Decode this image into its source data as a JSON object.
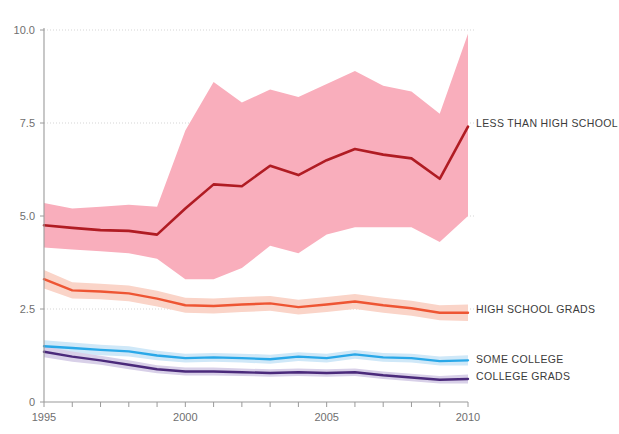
{
  "chart_data": {
    "type": "line",
    "title": "",
    "subtitle": "",
    "xlabel": "",
    "ylabel": "",
    "xlim": [
      1995,
      2010
    ],
    "ylim": [
      0,
      10
    ],
    "grid": true,
    "legend_position": "right-inline",
    "x": [
      1995,
      1996,
      1997,
      1998,
      1999,
      2000,
      2001,
      2002,
      2003,
      2004,
      2005,
      2006,
      2007,
      2008,
      2009,
      2010
    ],
    "x_ticks": [
      1995,
      1996,
      1997,
      1998,
      1999,
      2000,
      2001,
      2002,
      2003,
      2004,
      2005,
      2006,
      2007,
      2008,
      2009,
      2010
    ],
    "x_tick_labels": [
      "1995",
      "",
      "",
      "",
      "",
      "2000",
      "",
      "",
      "",
      "",
      "2005",
      "",
      "",
      "",
      "",
      "2010"
    ],
    "y_ticks": [
      0,
      2.5,
      5.0,
      7.5,
      10.0
    ],
    "y_tick_labels": [
      "0",
      "2.5",
      "5.0",
      "7.5",
      "10.0"
    ],
    "series": [
      {
        "name": "LESS THAN HIGH SCHOOL",
        "color": "#b01c23",
        "band_color": "#f9aebc",
        "label_y": 7.48,
        "values": [
          4.75,
          4.68,
          4.62,
          4.6,
          4.5,
          5.2,
          5.85,
          5.8,
          6.35,
          6.1,
          6.5,
          6.8,
          6.65,
          6.55,
          6.0,
          7.4
        ],
        "band_upper": [
          5.35,
          5.2,
          5.25,
          5.3,
          5.25,
          7.3,
          8.6,
          8.05,
          8.4,
          8.2,
          8.55,
          8.9,
          8.5,
          8.35,
          7.75,
          9.9
        ],
        "band_lower": [
          4.15,
          4.1,
          4.05,
          4.0,
          3.85,
          3.3,
          3.3,
          3.6,
          4.2,
          4.0,
          4.5,
          4.7,
          4.7,
          4.7,
          4.3,
          5.0
        ]
      },
      {
        "name": "HIGH SCHOOL GRADS",
        "color": "#ee5533",
        "band_color": "#fad4c8",
        "label_y": 2.48,
        "values": [
          3.3,
          3.0,
          2.97,
          2.92,
          2.78,
          2.6,
          2.58,
          2.62,
          2.65,
          2.55,
          2.62,
          2.7,
          2.6,
          2.52,
          2.4,
          2.4
        ],
        "band_upper": [
          3.55,
          3.22,
          3.18,
          3.13,
          2.99,
          2.8,
          2.78,
          2.82,
          2.85,
          2.75,
          2.82,
          2.9,
          2.8,
          2.72,
          2.6,
          2.62
        ],
        "band_lower": [
          3.05,
          2.78,
          2.76,
          2.71,
          2.57,
          2.4,
          2.38,
          2.42,
          2.45,
          2.35,
          2.42,
          2.5,
          2.4,
          2.32,
          2.2,
          2.18
        ]
      },
      {
        "name": "SOME COLLEGE",
        "color": "#29a8e8",
        "band_color": "#cfe8f8",
        "label_y": 1.12,
        "values": [
          1.5,
          1.45,
          1.4,
          1.36,
          1.25,
          1.18,
          1.2,
          1.18,
          1.15,
          1.22,
          1.18,
          1.28,
          1.2,
          1.18,
          1.1,
          1.12
        ],
        "band_upper": [
          1.66,
          1.6,
          1.54,
          1.5,
          1.38,
          1.3,
          1.32,
          1.3,
          1.27,
          1.34,
          1.3,
          1.4,
          1.32,
          1.3,
          1.22,
          1.26
        ],
        "band_lower": [
          1.34,
          1.3,
          1.26,
          1.22,
          1.12,
          1.06,
          1.08,
          1.06,
          1.03,
          1.1,
          1.06,
          1.16,
          1.08,
          1.06,
          0.98,
          0.98
        ]
      },
      {
        "name": "COLLEGE GRADS",
        "color": "#4b2a7b",
        "band_color": "#d8d0e8",
        "label_y": 0.66,
        "values": [
          1.35,
          1.22,
          1.12,
          1.0,
          0.88,
          0.82,
          0.82,
          0.8,
          0.78,
          0.8,
          0.78,
          0.8,
          0.72,
          0.66,
          0.6,
          0.62
        ],
        "band_upper": [
          1.5,
          1.36,
          1.24,
          1.12,
          0.99,
          0.93,
          0.93,
          0.9,
          0.88,
          0.9,
          0.88,
          0.9,
          0.82,
          0.76,
          0.7,
          0.74
        ],
        "band_lower": [
          1.2,
          1.08,
          1.0,
          0.88,
          0.77,
          0.71,
          0.71,
          0.7,
          0.68,
          0.7,
          0.68,
          0.7,
          0.62,
          0.56,
          0.5,
          0.5
        ]
      }
    ]
  }
}
